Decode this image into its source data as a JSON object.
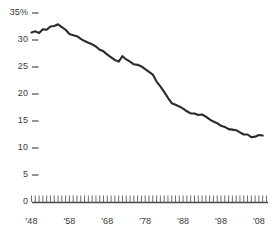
{
  "chart_data": {
    "type": "line",
    "title": "",
    "subtitle": "",
    "xlabel": "",
    "ylabel": "",
    "grid": false,
    "legend": "none",
    "line_color": "#2b2b2b",
    "axis_color": "#4a4a4a",
    "tick_label_color": "#3a3a3a",
    "xlim": [
      1948,
      2010
    ],
    "ylim": [
      0,
      35
    ],
    "y_ticks": [
      0,
      5,
      10,
      15,
      20,
      25,
      30,
      35
    ],
    "y_tick_labels": [
      "0",
      "5",
      "10",
      "15",
      "20",
      "25",
      "30",
      "35%"
    ],
    "x_ticks": [
      1948,
      1958,
      1968,
      1978,
      1988,
      1998,
      2008
    ],
    "x_tick_labels": [
      "'48",
      "'58",
      "'68",
      "'78",
      "'88",
      "'98",
      "'08"
    ],
    "x_minor_tick_interval": 1,
    "x": [
      1948,
      1949,
      1950,
      1951,
      1952,
      1953,
      1954,
      1955,
      1956,
      1957,
      1958,
      1959,
      1960,
      1961,
      1962,
      1963,
      1964,
      1965,
      1966,
      1967,
      1968,
      1969,
      1970,
      1971,
      1972,
      1973,
      1974,
      1975,
      1976,
      1977,
      1978,
      1979,
      1980,
      1981,
      1982,
      1983,
      1984,
      1985,
      1986,
      1987,
      1988,
      1989,
      1990,
      1991,
      1992,
      1993,
      1994,
      1995,
      1996,
      1997,
      1998,
      1999,
      2000,
      2001,
      2002,
      2003,
      2004,
      2005,
      2006,
      2007,
      2008,
      2009
    ],
    "values": [
      31.4,
      31.6,
      31.3,
      32.0,
      31.9,
      32.5,
      32.6,
      32.9,
      32.4,
      31.9,
      31.1,
      30.9,
      30.7,
      30.2,
      29.8,
      29.5,
      29.2,
      28.8,
      28.2,
      27.9,
      27.3,
      26.8,
      26.3,
      26.0,
      27.0,
      26.4,
      26.0,
      25.5,
      25.4,
      25.1,
      24.6,
      24.1,
      23.6,
      22.3,
      21.4,
      20.4,
      19.3,
      18.3,
      18.0,
      17.7,
      17.3,
      16.8,
      16.4,
      16.4,
      16.1,
      16.2,
      15.8,
      15.3,
      14.9,
      14.6,
      14.1,
      13.9,
      13.5,
      13.4,
      13.3,
      12.9,
      12.5,
      12.5,
      12.0,
      12.1,
      12.4,
      12.3
    ],
    "series_name": "Union membership share",
    "data_note": "Percentage of wage and salary workers who are union members, 1948-2009"
  }
}
